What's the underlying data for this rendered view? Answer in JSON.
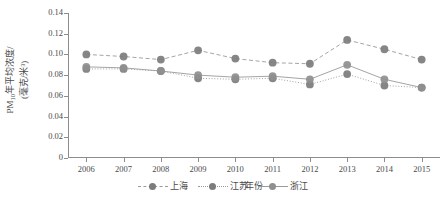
{
  "chart_data": {
    "type": "line",
    "title": "",
    "xlabel": "年份",
    "ylabel_line1": "PM",
    "ylabel_sub": "10",
    "ylabel_line1_rest": "年平均浓度/",
    "ylabel_line2": "(毫克/米³)",
    "categories": [
      "2006",
      "2007",
      "2008",
      "2009",
      "2010",
      "2011",
      "2012",
      "2013",
      "2014",
      "2015"
    ],
    "ylim": [
      0,
      0.14
    ],
    "yticks": [
      "0",
      "0.02",
      "0.04",
      "0.06",
      "0.08",
      "0.10",
      "0.12",
      "0.14"
    ],
    "ytick_values": [
      0,
      0.02,
      0.04,
      0.06,
      0.08,
      0.1,
      0.12,
      0.14
    ],
    "grid": false,
    "legend_position": "bottom-center",
    "series": [
      {
        "name": "上海",
        "line_style": "dashed",
        "color": "#7c7c7c",
        "line_color": "#9a9a9a",
        "values": [
          0.1,
          0.098,
          0.095,
          0.104,
          0.096,
          0.092,
          0.091,
          0.114,
          0.105,
          0.095
        ]
      },
      {
        "name": "江苏",
        "line_style": "dotted",
        "color": "#7c7c7c",
        "line_color": "#9a9a9a",
        "values": [
          0.086,
          0.086,
          0.084,
          0.077,
          0.076,
          0.077,
          0.071,
          0.081,
          0.07,
          0.068
        ]
      },
      {
        "name": "浙江",
        "line_style": "solid",
        "color": "#8f8f8f",
        "line_color": "#9a9a9a",
        "values": [
          0.088,
          0.087,
          0.084,
          0.08,
          0.078,
          0.079,
          0.076,
          0.09,
          0.076,
          0.068
        ]
      }
    ]
  }
}
